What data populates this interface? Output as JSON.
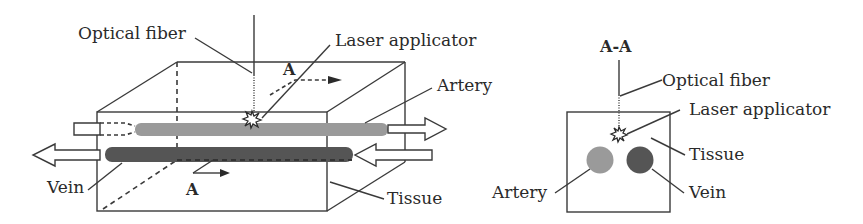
{
  "figure": {
    "left_view": {
      "labels": {
        "optical_fiber": "Optical fiber",
        "laser_applicator": "Laser applicator",
        "artery": "Artery",
        "vein": "Vein",
        "tissue": "Tissue",
        "section_marker_top": "A",
        "section_marker_bottom": "A"
      }
    },
    "right_view": {
      "title": "A-A",
      "labels": {
        "optical_fiber": "Optical fiber",
        "laser_applicator": "Laser applicator",
        "tissue": "Tissue",
        "artery": "Artery",
        "vein": "Vein"
      }
    },
    "colors": {
      "artery": "#9a9a9a",
      "vein": "#555555",
      "line": "#3a3a3a"
    }
  }
}
